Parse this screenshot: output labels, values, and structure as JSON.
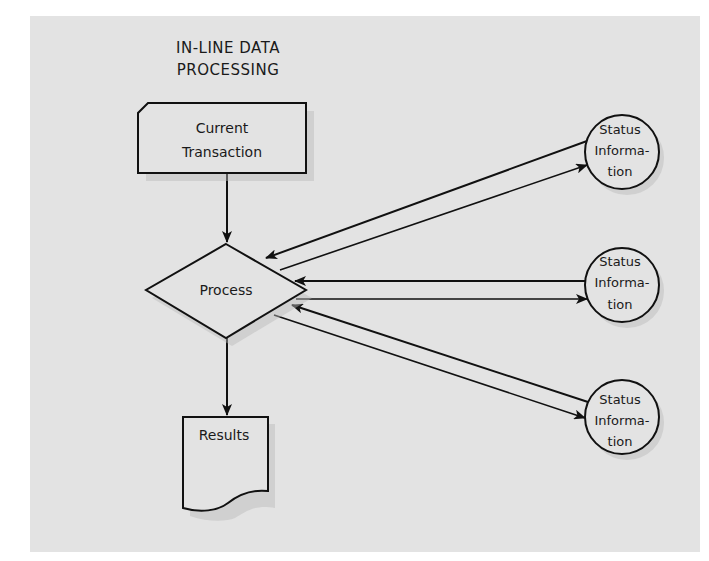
{
  "diagram": {
    "title_lines": [
      "IN-LINE DATA",
      "PROCESSING"
    ],
    "nodes": {
      "current_transaction": {
        "type": "card",
        "lines": [
          "Current",
          "Transaction"
        ]
      },
      "process": {
        "type": "decision-diamond",
        "label": "Process"
      },
      "results": {
        "type": "document",
        "label": "Results"
      },
      "status_1": {
        "type": "circle",
        "lines": [
          "Status",
          "Informa-",
          "tion"
        ]
      },
      "status_2": {
        "type": "circle",
        "lines": [
          "Status",
          "Informa-",
          "tion"
        ]
      },
      "status_3": {
        "type": "circle",
        "lines": [
          "Status",
          "Informa-",
          "tion"
        ]
      }
    },
    "edges": [
      {
        "from": "current_transaction",
        "to": "process"
      },
      {
        "from": "process",
        "to": "results"
      },
      {
        "from": "status_1",
        "to": "process"
      },
      {
        "from": "process",
        "to": "status_1"
      },
      {
        "from": "status_2",
        "to": "process"
      },
      {
        "from": "process",
        "to": "status_2"
      },
      {
        "from": "status_3",
        "to": "process"
      },
      {
        "from": "process",
        "to": "status_3"
      }
    ],
    "colors": {
      "panel": "#e3e3e3",
      "page": "#ffffff",
      "ink": "#111111"
    }
  }
}
